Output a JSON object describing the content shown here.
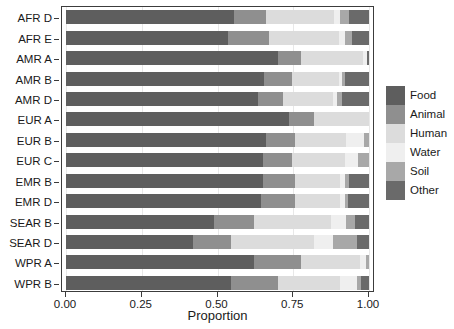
{
  "chart_data": {
    "type": "bar",
    "orientation": "horizontal",
    "stacked": true,
    "normalized": true,
    "title": "",
    "xlabel": "Proportion",
    "ylabel": "",
    "xlim": [
      0,
      1
    ],
    "grid": true,
    "legend_position": "right",
    "xticks": [
      "0.00",
      "0.25",
      "0.50",
      "0.75",
      "1.00"
    ],
    "xtick_values": [
      0.0,
      0.25,
      0.5,
      0.75,
      1.0
    ],
    "categories": [
      "AFR D",
      "AFR E",
      "AMR A",
      "AMR B",
      "AMR D",
      "EUR A",
      "EUR B",
      "EUR C",
      "EMR B",
      "EMR D",
      "SEAR B",
      "SEAR D",
      "WPR A",
      "WPR B"
    ],
    "series": [
      {
        "name": "Food",
        "color": "#5e5e5e",
        "values": [
          0.555,
          0.535,
          0.7,
          0.655,
          0.635,
          0.735,
          0.66,
          0.65,
          0.65,
          0.645,
          0.49,
          0.42,
          0.62,
          0.545
        ]
      },
      {
        "name": "Animal",
        "color": "#8f8f8f",
        "values": [
          0.105,
          0.135,
          0.075,
          0.09,
          0.08,
          0.085,
          0.095,
          0.095,
          0.105,
          0.11,
          0.13,
          0.125,
          0.155,
          0.155
        ]
      },
      {
        "name": "Human",
        "color": "#dcdcdc",
        "values": [
          0.225,
          0.23,
          0.205,
          0.155,
          0.165,
          0.18,
          0.17,
          0.175,
          0.15,
          0.15,
          0.255,
          0.275,
          0.195,
          0.205
        ]
      },
      {
        "name": "Water",
        "color": "#efefef",
        "values": [
          0.02,
          0.02,
          0.015,
          0.01,
          0.015,
          0.0,
          0.06,
          0.045,
          0.015,
          0.015,
          0.05,
          0.06,
          0.02,
          0.055
        ]
      },
      {
        "name": "Soil",
        "color": "#a8a8a8",
        "values": [
          0.03,
          0.025,
          0.0,
          0.01,
          0.015,
          0.0,
          0.015,
          0.035,
          0.015,
          0.01,
          0.03,
          0.08,
          0.01,
          0.015
        ]
      },
      {
        "name": "Other",
        "color": "#6a6a6a",
        "values": [
          0.065,
          0.055,
          0.005,
          0.08,
          0.09,
          0.0,
          0.0,
          0.0,
          0.065,
          0.07,
          0.045,
          0.04,
          0.0,
          0.025
        ]
      }
    ]
  },
  "legend": {
    "items": [
      {
        "label": "Food",
        "color": "#5e5e5e"
      },
      {
        "label": "Animal",
        "color": "#8f8f8f"
      },
      {
        "label": "Human",
        "color": "#dcdcdc"
      },
      {
        "label": "Water",
        "color": "#efefef"
      },
      {
        "label": "Soil",
        "color": "#a8a8a8"
      },
      {
        "label": "Other",
        "color": "#6a6a6a"
      }
    ]
  },
  "axis": {
    "x_title": "Proportion"
  },
  "colors": {
    "panel_border": "#3c3c3c",
    "gridline": "#e8e8e8",
    "background": "#ffffff",
    "text": "#1a1a1a"
  }
}
